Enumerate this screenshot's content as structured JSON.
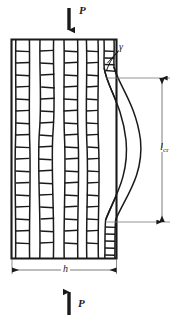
{
  "figure": {
    "type": "engineering-diagram",
    "colors": {
      "ink": "#1a1a1a",
      "thin_line": "#6e6e6e",
      "background": "#ffffff"
    },
    "labels": {
      "load_top": "P",
      "load_bottom": "P",
      "gamma": "γ",
      "width": "h",
      "critical_length": "l",
      "critical_length_sub": "cr"
    },
    "icons": {
      "load_top": "arrow-down-icon",
      "load_bottom": "arrow-up-icon",
      "width_dimension": "double-arrow-horizontal-icon",
      "length_dimension": "double-arrow-vertical-icon",
      "leader": "leader-line-icon"
    },
    "geometry": {
      "block": {
        "x": 11.5,
        "y": 39.5,
        "width": 105,
        "height": 219
      },
      "fiber_columns": 5,
      "ladder_rungs": 18,
      "buckled_fiber_peak_x": 143,
      "dimension_line_x": 162,
      "dimension_top_y": 78,
      "dimension_bottom_y": 222,
      "width_dimension_y": 270
    }
  }
}
